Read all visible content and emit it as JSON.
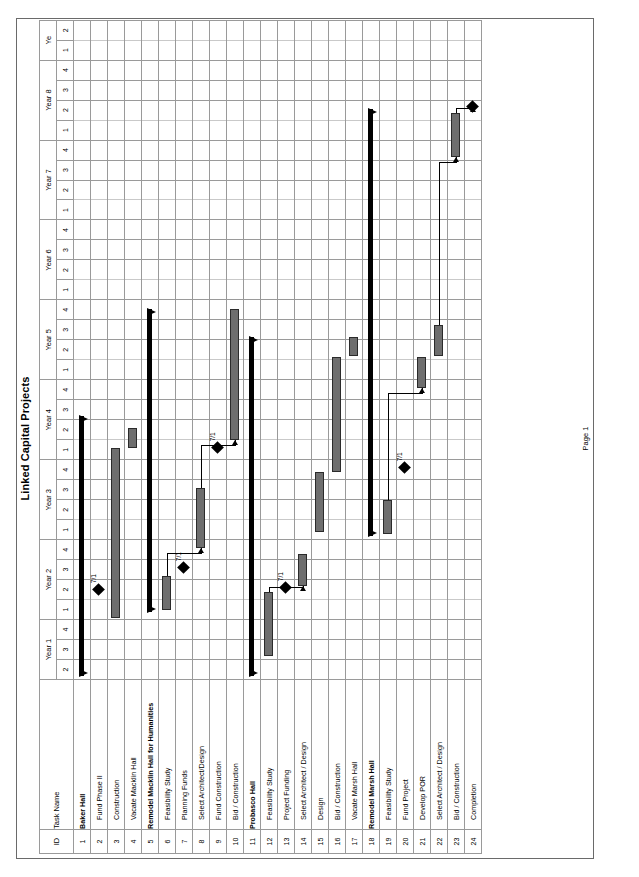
{
  "document": {
    "title": "Linked Capital Projects",
    "footer": "Page 1"
  },
  "columns": {
    "id_header": "ID",
    "name_header": "Task Name"
  },
  "timeline": {
    "years": [
      {
        "label": "Year 1",
        "quarters": [
          "2",
          "3",
          "4"
        ]
      },
      {
        "label": "Year 2",
        "quarters": [
          "1",
          "2",
          "3",
          "4"
        ]
      },
      {
        "label": "Year 3",
        "quarters": [
          "1",
          "2",
          "3",
          "4"
        ]
      },
      {
        "label": "Year 4",
        "quarters": [
          "1",
          "2",
          "3",
          "4"
        ]
      },
      {
        "label": "Year 5",
        "quarters": [
          "1",
          "2",
          "3",
          "4"
        ]
      },
      {
        "label": "Year 6",
        "quarters": [
          "1",
          "2",
          "3",
          "4"
        ]
      },
      {
        "label": "Year 7",
        "quarters": [
          "1",
          "2",
          "3",
          "4"
        ]
      },
      {
        "label": "Year 8",
        "quarters": [
          "1",
          "2",
          "3",
          "4"
        ]
      },
      {
        "label": "Ye",
        "quarters": [
          "1",
          "2"
        ]
      }
    ]
  },
  "rows": [
    {
      "id": "1",
      "name": "Baker Hall",
      "type": "summary"
    },
    {
      "id": "2",
      "name": "Fund Phase II",
      "type": "milestone"
    },
    {
      "id": "3",
      "name": "Construction",
      "type": "task"
    },
    {
      "id": "4",
      "name": "Vacate Macklin Hall",
      "type": "task"
    },
    {
      "id": "5",
      "name": "Remodel Macklin Hall for Humanities",
      "type": "summary"
    },
    {
      "id": "6",
      "name": "Feasibility Study",
      "type": "task"
    },
    {
      "id": "7",
      "name": "Planning Funds",
      "type": "task"
    },
    {
      "id": "8",
      "name": "Select Architect/Design",
      "type": "task"
    },
    {
      "id": "9",
      "name": "Fund Construction",
      "type": "milestone"
    },
    {
      "id": "10",
      "name": "Bid / Construction",
      "type": "task"
    },
    {
      "id": "11",
      "name": "Probasco Hall",
      "type": "summary"
    },
    {
      "id": "12",
      "name": "Feasibility Study",
      "type": "task"
    },
    {
      "id": "13",
      "name": "Project Funding",
      "type": "milestone"
    },
    {
      "id": "14",
      "name": "Select Architect / Design",
      "type": "task"
    },
    {
      "id": "15",
      "name": "Design",
      "type": "task"
    },
    {
      "id": "16",
      "name": "Bid / Construction",
      "type": "task"
    },
    {
      "id": "17",
      "name": "Vacate Marsh Hall",
      "type": "task"
    },
    {
      "id": "18",
      "name": "Remodel Marsh Hall",
      "type": "summary"
    },
    {
      "id": "19",
      "name": "Feasibility Study",
      "type": "task"
    },
    {
      "id": "20",
      "name": "Fund Project",
      "type": "task"
    },
    {
      "id": "21",
      "name": "Develop POR",
      "type": "task"
    },
    {
      "id": "22",
      "name": "Select Architect / Design",
      "type": "task"
    },
    {
      "id": "23",
      "name": "Bid / Construction",
      "type": "task"
    },
    {
      "id": "24",
      "name": "Completion",
      "type": "milestone"
    }
  ],
  "bars": [
    {
      "row": 1,
      "kind": "summary",
      "start_q": 0.2,
      "end_q": 13.2
    },
    {
      "row": 2,
      "kind": "milestone",
      "at_q": 4.5,
      "label": "7/1"
    },
    {
      "row": 3,
      "kind": "task",
      "start_q": 3.1,
      "end_q": 11.6
    },
    {
      "row": 4,
      "kind": "task",
      "start_q": 11.6,
      "end_q": 12.6
    },
    {
      "row": 5,
      "kind": "summary",
      "start_q": 3.4,
      "end_q": 18.6
    },
    {
      "row": 6,
      "kind": "task",
      "start_q": 3.5,
      "end_q": 5.2
    },
    {
      "row": 7,
      "kind": "milestone",
      "at_q": 5.6,
      "label": "7/1"
    },
    {
      "row": 8,
      "kind": "task",
      "start_q": 6.6,
      "end_q": 9.6
    },
    {
      "row": 9,
      "kind": "milestone",
      "at_q": 11.6,
      "label": "7/1"
    },
    {
      "row": 10,
      "kind": "task",
      "start_q": 12.0,
      "end_q": 18.6
    },
    {
      "row": 11,
      "kind": "summary",
      "start_q": 0.2,
      "end_q": 17.2
    },
    {
      "row": 12,
      "kind": "task",
      "start_q": 1.2,
      "end_q": 4.4
    },
    {
      "row": 13,
      "kind": "milestone",
      "at_q": 4.6,
      "label": "7/1"
    },
    {
      "row": 14,
      "kind": "task",
      "start_q": 4.7,
      "end_q": 6.3
    },
    {
      "row": 15,
      "kind": "task",
      "start_q": 7.4,
      "end_q": 10.4
    },
    {
      "row": 16,
      "kind": "task",
      "start_q": 10.4,
      "end_q": 16.2
    },
    {
      "row": 17,
      "kind": "task",
      "start_q": 16.2,
      "end_q": 17.2
    },
    {
      "row": 18,
      "kind": "summary",
      "start_q": 7.2,
      "end_q": 28.6
    },
    {
      "row": 19,
      "kind": "task",
      "start_q": 7.3,
      "end_q": 9.0
    },
    {
      "row": 20,
      "kind": "milestone",
      "at_q": 10.6,
      "label": "7/1"
    },
    {
      "row": 21,
      "kind": "task",
      "start_q": 14.6,
      "end_q": 16.2
    },
    {
      "row": 22,
      "kind": "task",
      "start_q": 16.2,
      "end_q": 17.8
    },
    {
      "row": 23,
      "kind": "task",
      "start_q": 26.2,
      "end_q": 28.4
    },
    {
      "row": 24,
      "kind": "milestone",
      "at_q": 28.7,
      "label": ""
    }
  ],
  "links": [
    {
      "from_row": 6,
      "to_row": 8,
      "note": "feasibility-to-design"
    },
    {
      "from_row": 8,
      "to_row": 10,
      "note": "design-to-construction"
    },
    {
      "from_row": 12,
      "to_row": 14,
      "note": "feasibility-to-design"
    },
    {
      "from_row": 19,
      "to_row": 21,
      "note": "feasibility-to-por"
    },
    {
      "from_row": 22,
      "to_row": 23,
      "note": "design-to-construction"
    },
    {
      "from_row": 23,
      "to_row": 24,
      "note": "construction-to-completion"
    }
  ],
  "colors": {
    "task_bar_fill": "#6e6e6e",
    "task_bar_border": "#2b2b2b",
    "summary_bar": "#000000",
    "grid_line": "#9a9a9a",
    "sheet_border": "#6a6a6a"
  },
  "chart_data": {
    "type": "bar",
    "title": "Linked Capital Projects",
    "xlabel": "",
    "ylabel": "",
    "grid": true,
    "legend": "none",
    "categories": [
      "Baker Hall",
      "Fund Phase II",
      "Construction",
      "Vacate Macklin Hall",
      "Remodel Macklin Hall for Humanities",
      "Feasibility Study",
      "Planning Funds",
      "Select Architect/Design",
      "Fund Construction",
      "Bid / Construction",
      "Probasco Hall",
      "Feasibility Study",
      "Project Funding",
      "Select Architect / Design",
      "Design",
      "Bid / Construction",
      "Vacate Marsh Hall",
      "Remodel Marsh Hall",
      "Feasibility Study",
      "Fund Project",
      "Develop POR",
      "Select Architect / Design",
      "Bid / Construction",
      "Completion"
    ],
    "x_ticks": [
      "Year 1 Q2",
      "Year 1 Q3",
      "Year 1 Q4",
      "Year 2 Q1",
      "Year 2 Q2",
      "Year 2 Q3",
      "Year 2 Q4",
      "Year 3 Q1",
      "Year 3 Q2",
      "Year 3 Q3",
      "Year 3 Q4",
      "Year 4 Q1",
      "Year 4 Q2",
      "Year 4 Q3",
      "Year 4 Q4",
      "Year 5 Q1",
      "Year 5 Q2",
      "Year 5 Q3",
      "Year 5 Q4",
      "Year 6 Q1",
      "Year 6 Q2",
      "Year 6 Q3",
      "Year 6 Q4",
      "Year 7 Q1",
      "Year 7 Q2",
      "Year 7 Q3",
      "Year 7 Q4",
      "Year 8 Q1",
      "Year 8 Q2",
      "Year 8 Q3",
      "Year 8 Q4",
      "Year 9 Q1",
      "Year 9 Q2"
    ],
    "xlim": [
      0,
      33
    ],
    "series": [
      {
        "name": "task-duration-quarters",
        "values": [
          13.0,
          0,
          8.5,
          1.0,
          15.2,
          1.7,
          0,
          3.0,
          0,
          6.6,
          17.0,
          3.2,
          0,
          1.6,
          3.0,
          5.8,
          1.0,
          21.4,
          1.7,
          0,
          1.6,
          1.6,
          2.2,
          0
        ]
      }
    ],
    "milestone_labels": [
      "7/1",
      "7/1",
      "7/1",
      "7/1",
      "7/1"
    ]
  }
}
